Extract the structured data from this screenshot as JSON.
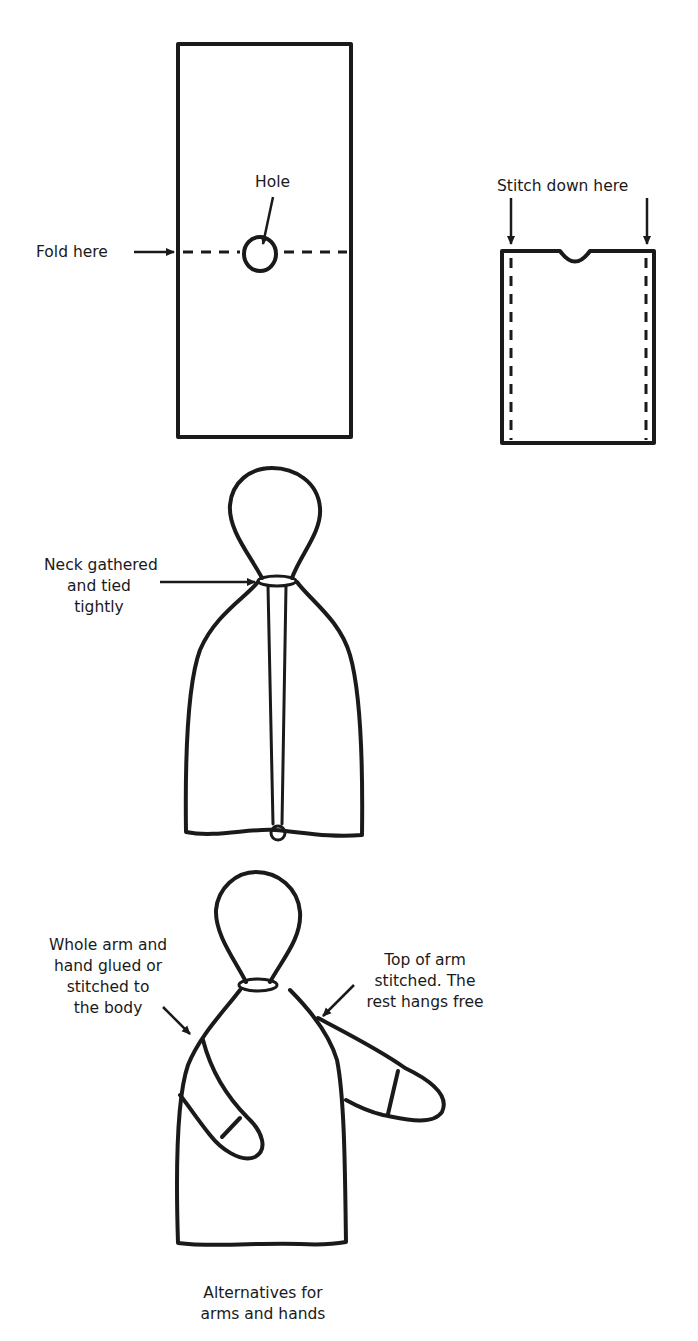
{
  "figure": {
    "step1": {
      "fold_label": "Fold here",
      "hole_label": "Hole"
    },
    "step2": {
      "stitch_label": "Stitch down here"
    },
    "step3": {
      "neck_label_lines": [
        "Neck gathered",
        "and tied",
        "tightly"
      ]
    },
    "step4": {
      "left_label_lines": [
        "Whole arm and",
        "hand  glued or",
        "stitched to",
        "the body"
      ],
      "right_label_lines": [
        "Top of arm",
        "stitched. The",
        "rest hangs free"
      ],
      "caption_lines": [
        "Alternatives for",
        "arms and hands"
      ]
    }
  }
}
